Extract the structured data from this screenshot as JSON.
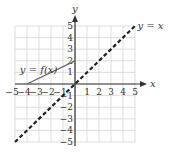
{
  "chart_data": {
    "type": "line",
    "title": "",
    "xlabel": "x",
    "ylabel": "y",
    "xlim": [
      -5,
      5
    ],
    "ylim": [
      -5,
      5
    ],
    "grid": true,
    "x_ticks": [
      "-5",
      "-4",
      "-3",
      "-2",
      "-1",
      "1",
      "2",
      "3",
      "4",
      "5"
    ],
    "y_ticks": [
      "5",
      "4",
      "3",
      "2",
      "1",
      "-1",
      "-2",
      "-3",
      "-4",
      "-5"
    ],
    "series": [
      {
        "name": "y = f(x)",
        "style": "solid",
        "color": "#666666",
        "points": [
          [
            -4,
            0
          ],
          [
            0,
            2
          ]
        ]
      },
      {
        "name": "y = x",
        "style": "dashed",
        "color": "#222222",
        "points": [
          [
            -5,
            -5
          ],
          [
            5,
            5
          ]
        ]
      }
    ],
    "annotations": [
      {
        "text": "y = f(x)",
        "x": -4.6,
        "y": 1.2
      },
      {
        "text": "y = x",
        "x": 5.2,
        "y": 5
      }
    ]
  }
}
